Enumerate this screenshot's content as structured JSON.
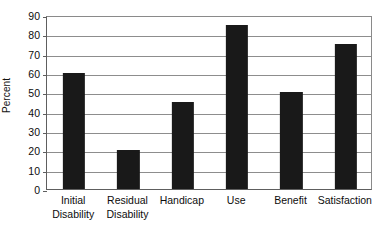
{
  "chart_data": {
    "type": "bar",
    "title": "",
    "subtitle": "",
    "xlabel": "",
    "ylabel": "Percent",
    "categories": [
      "Initial\nDisability",
      "Residual\nDisability",
      "Handicap",
      "Use",
      "Benefit",
      "Satisfaction"
    ],
    "values": [
      60,
      20,
      45,
      85,
      50,
      75
    ],
    "ylim": [
      0,
      90
    ],
    "ytick_labels": [
      "0",
      "10",
      "20",
      "30",
      "40",
      "50",
      "60",
      "70",
      "80",
      "90"
    ],
    "ytick_values": [
      0,
      10,
      20,
      30,
      40,
      50,
      60,
      70,
      80,
      90
    ],
    "grid": true,
    "grid_axis": "y",
    "legend": false,
    "legend_position": "none",
    "bar_color": "#191919",
    "grid_color": "#8d8d8d",
    "axis_color": "#5e5e5e",
    "background_color": "#ffffff",
    "bar_width_ratio": 0.41
  }
}
